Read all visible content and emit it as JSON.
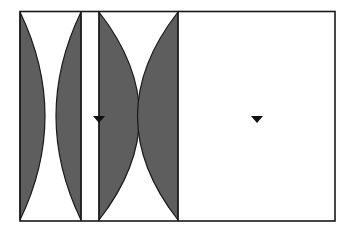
{
  "diagram": {
    "title": "",
    "colors": {
      "background": "#ffffff",
      "stroke": "#1a1a1a",
      "lens_fill": "#5e5e5e",
      "marker": "#111111"
    },
    "frame": {
      "x": 20,
      "y": 11,
      "width": 315,
      "height": 210
    },
    "dividers_x": [
      81,
      99,
      178
    ],
    "markers": [
      {
        "name": "focal-marker-left",
        "x": 99,
        "y": 119
      },
      {
        "name": "focal-marker-right",
        "x": 257,
        "y": 119
      }
    ],
    "labels": []
  }
}
